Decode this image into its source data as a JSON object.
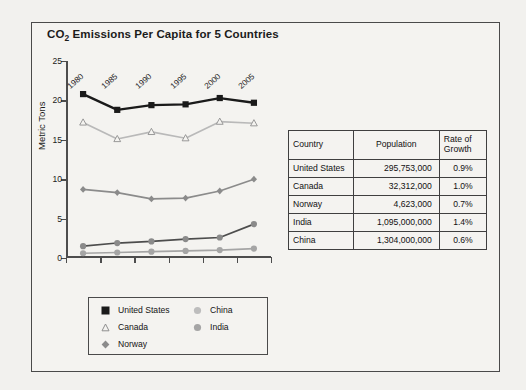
{
  "chart_data": {
    "type": "line",
    "title": "CO2 Emissions Per Capita for 5 Countries",
    "title_main": "CO",
    "title_sub": "2",
    "title_rest": " Emissions Per Capita for 5 Countries",
    "xlabel": "",
    "ylabel": "Metric Tons",
    "ylim": [
      0,
      25
    ],
    "yticks": [
      25,
      20,
      15,
      10,
      5,
      0
    ],
    "categories": [
      "1980",
      "1985",
      "1990",
      "1995",
      "2000",
      "2005"
    ],
    "grid": false,
    "legend_position": "bottom",
    "series": [
      {
        "name": "United States",
        "marker": "filled-square",
        "color": "#1a1a1a",
        "values": [
          20.8,
          18.8,
          19.4,
          19.5,
          20.3,
          19.7
        ]
      },
      {
        "name": "Canada",
        "marker": "open-triangle",
        "color": "#b9b9b9",
        "values": [
          17.2,
          15.1,
          16.0,
          15.2,
          17.3,
          17.1
        ]
      },
      {
        "name": "Norway",
        "marker": "filled-diamond",
        "color": "#8b8b8b",
        "values": [
          8.7,
          8.3,
          7.5,
          7.6,
          8.5,
          10.0
        ]
      },
      {
        "name": "China",
        "marker": "filled-circle-light",
        "color": "#4d4d4d",
        "values": [
          1.5,
          1.9,
          2.1,
          2.4,
          2.6,
          4.3
        ]
      },
      {
        "name": "India",
        "marker": "filled-circle",
        "color": "#a5a5a5",
        "values": [
          0.6,
          0.7,
          0.8,
          0.9,
          1.0,
          1.2
        ]
      }
    ]
  },
  "legend": {
    "items": [
      {
        "label": "United States",
        "marker": "filled-square"
      },
      {
        "label": "Canada",
        "marker": "open-triangle"
      },
      {
        "label": "Norway",
        "marker": "filled-diamond"
      },
      {
        "label": "China",
        "marker": "filled-circle-light"
      },
      {
        "label": "India",
        "marker": "filled-circle"
      }
    ]
  },
  "table": {
    "headers": [
      "Country",
      "Population",
      "Rate of Growth"
    ],
    "header_country": "Country",
    "header_population": "Population",
    "header_rate_line1": "Rate of",
    "header_rate_line2": "Growth",
    "rows": [
      {
        "country": "United States",
        "population": "295,753,000",
        "rate": "0.9%"
      },
      {
        "country": "Canada",
        "population": "32,312,000",
        "rate": "1.0%"
      },
      {
        "country": "Norway",
        "population": "4,623,000",
        "rate": "0.7%"
      },
      {
        "country": "India",
        "population": "1,095,000,000",
        "rate": "1.4%"
      },
      {
        "country": "China",
        "population": "1,304,000,000",
        "rate": "0.6%"
      }
    ]
  },
  "colors": {
    "page_background": "#f2f1ee",
    "frame_border": "#4a4a4a",
    "axis": "#4d4d4d",
    "text": "#1b1b1b"
  }
}
